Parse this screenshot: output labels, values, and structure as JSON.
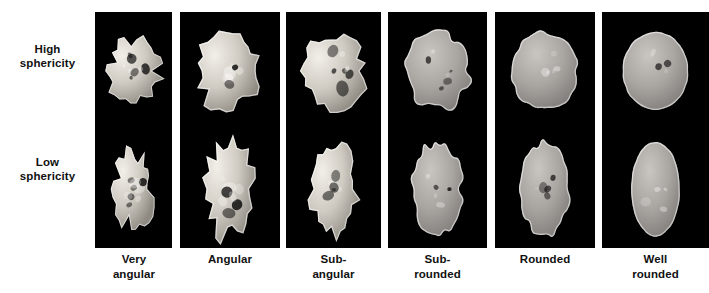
{
  "figure": {
    "type": "image-grid",
    "background_color": "#ffffff",
    "panel_color": "#000000",
    "text_color": "#111111"
  },
  "row_labels": [
    {
      "id": "high-sphericity",
      "line1": "High",
      "line2": "sphericity"
    },
    {
      "id": "low-sphericity",
      "line1": "Low",
      "line2": "sphericity"
    }
  ],
  "columns": [
    {
      "id": "very-angular",
      "line1": "Very",
      "line2": "angular",
      "x": 0,
      "width": 77,
      "label_x": -6,
      "label_width": 90,
      "grains": {
        "high": "very-angular-high-sphericity-grain",
        "low": "very-angular-low-sphericity-grain"
      }
    },
    {
      "id": "angular",
      "line1": "Angular",
      "line2": "",
      "x": 85,
      "width": 100,
      "label_x": 82,
      "label_width": 106,
      "grains": {
        "high": "angular-high-sphericity-grain",
        "low": "angular-low-sphericity-grain"
      }
    },
    {
      "id": "sub-angular",
      "line1": "Sub-",
      "line2": "angular",
      "x": 191,
      "width": 95,
      "label_x": 188,
      "label_width": 101,
      "grains": {
        "high": "sub-angular-high-sphericity-grain",
        "low": "sub-angular-low-sphericity-grain"
      }
    },
    {
      "id": "sub-rounded",
      "line1": "Sub-",
      "line2": "rounded",
      "x": 293,
      "width": 99,
      "label_x": 290,
      "label_width": 105,
      "grains": {
        "high": "sub-rounded-high-sphericity-grain",
        "low": "sub-rounded-low-sphericity-grain"
      }
    },
    {
      "id": "rounded",
      "line1": "Rounded",
      "line2": "",
      "x": 400,
      "width": 100,
      "label_x": 397,
      "label_width": 106,
      "grains": {
        "high": "rounded-high-sphericity-grain",
        "low": "rounded-low-sphericity-grain"
      }
    },
    {
      "id": "well-rounded",
      "line1": "Well",
      "line2": "rounded",
      "x": 507,
      "width": 107,
      "label_x": 504,
      "label_width": 113,
      "grains": {
        "high": "well-rounded-high-sphericity-grain",
        "low": "well-rounded-low-sphericity-grain"
      }
    }
  ]
}
